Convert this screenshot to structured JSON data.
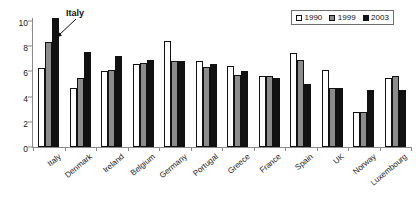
{
  "chart_data": {
    "type": "bar",
    "title": "",
    "xlabel": "",
    "ylabel": "",
    "ylim": [
      0,
      10
    ],
    "yticks": [
      0,
      2,
      4,
      6,
      8,
      10
    ],
    "grid": false,
    "legend_position": "top-right",
    "categories": [
      "Italy",
      "Denmark",
      "Ireland",
      "Belgium",
      "Germany",
      "Portugal",
      "Greece",
      "France",
      "Spain",
      "UK",
      "Norway",
      "Luxembourg"
    ],
    "series": [
      {
        "name": "1990",
        "color": "#ffffff",
        "values": [
          6.3,
          4.65,
          6.05,
          6.55,
          8.45,
          6.85,
          6.45,
          5.65,
          7.5,
          6.1,
          2.8,
          5.5
        ]
      },
      {
        "name": "1999",
        "color": "#8c8c8c",
        "values": [
          8.35,
          5.5,
          6.1,
          6.65,
          6.85,
          6.35,
          5.7,
          5.6,
          6.9,
          4.7,
          2.8,
          5.6
        ]
      },
      {
        "name": "2003",
        "color": "#121212",
        "values": [
          10.2,
          7.55,
          7.25,
          6.9,
          6.8,
          6.55,
          6.05,
          5.45,
          5.0,
          4.65,
          4.5,
          4.5
        ]
      }
    ],
    "annotations": [
      {
        "text": "Italy",
        "target_category": "Italy",
        "target_series": "2003"
      }
    ]
  },
  "legend": {
    "entries": [
      {
        "label": "1990",
        "swatch": "hollow-square-icon"
      },
      {
        "label": "1999",
        "swatch": "gray-square-icon"
      },
      {
        "label": "2003",
        "swatch": "black-square-icon"
      }
    ]
  },
  "axis": {
    "y_tick_labels": [
      "10",
      "8",
      "6",
      "4",
      "2",
      "0"
    ]
  }
}
